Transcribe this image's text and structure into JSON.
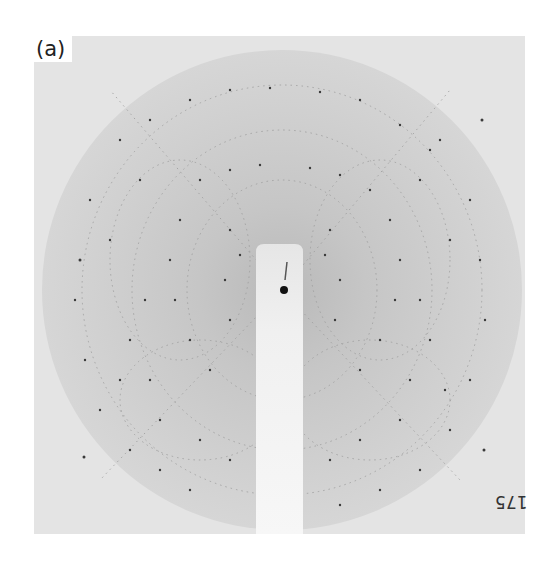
{
  "figure": {
    "panel_label": "(a)",
    "film_number": "175",
    "colors": {
      "background": "#e4e4e4",
      "disc": "#cfcfcf",
      "disc_inner": "#c2c2c2",
      "beam_stop": "#f2f2f2",
      "spots": "#3a3a3a"
    },
    "disc": {
      "cx": 282,
      "cy": 290,
      "r": 240
    },
    "beam_stop": {
      "x": 256,
      "y": 244,
      "width": 47,
      "bottom": 534
    },
    "direct_beam": {
      "cx": 284,
      "cy": 290,
      "r": 4
    }
  }
}
